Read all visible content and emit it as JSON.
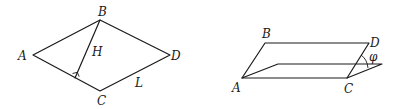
{
  "figures": [
    {
      "id": "rhombus",
      "labels": {
        "A": "A",
        "B": "B",
        "C": "C",
        "D": "D",
        "height": "H",
        "side": "L"
      },
      "right_angle_marker": true
    },
    {
      "id": "inclined-plane",
      "labels": {
        "A": "A",
        "B": "B",
        "C": "C",
        "D": "D",
        "angle": "φ"
      }
    }
  ],
  "colors": {
    "stroke": "#1a1a1a",
    "background": "#ffffff"
  }
}
